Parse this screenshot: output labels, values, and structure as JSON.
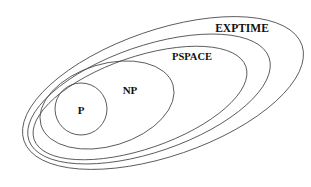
{
  "figure": {
    "background_color": "#ffffff",
    "stroke_color": "#4a4a4a",
    "label_color": "#111111",
    "width": 311,
    "height": 187
  },
  "chart_data": {
    "type": "diagram",
    "subtype": "nested-euler-diagram",
    "title": "",
    "xlabel": "",
    "ylabel": "",
    "legend": [],
    "relation": "P ⊆ NP ⊆ PSPACE ⊆ EXPTIME",
    "regions": [
      {
        "id": "exptime",
        "label": "EXPTIME",
        "shape": "ellipse",
        "cx": 163,
        "cy": 93,
        "rx": 147,
        "ry": 63,
        "rotation": -19,
        "contains": "pspace",
        "label_x": 242,
        "label_y": 29,
        "label_size": 11.5
      },
      {
        "id": "pspace",
        "label": "PSPACE",
        "shape": "ellipse",
        "cx": 149,
        "cy": 99,
        "rx": 127,
        "ry": 53,
        "rotation": -19,
        "contains": "unlabeled-inner",
        "label_x": 192,
        "label_y": 58,
        "label_size": 10.5
      },
      {
        "id": "unlabeled-inner",
        "label": "",
        "shape": "ellipse",
        "cx": 140,
        "cy": 103,
        "rx": 112,
        "ry": 46,
        "rotation": -19,
        "contains": "np",
        "label_x": 0,
        "label_y": 0,
        "label_size": 0
      },
      {
        "id": "np",
        "label": "NP",
        "shape": "ellipse",
        "cx": 107,
        "cy": 105,
        "rx": 69,
        "ry": 41,
        "rotation": -17,
        "contains": "p",
        "label_x": 130,
        "label_y": 91,
        "label_size": 11
      },
      {
        "id": "p",
        "label": "P",
        "shape": "ellipse",
        "cx": 81,
        "cy": 109,
        "rx": 26,
        "ry": 26,
        "rotation": 0,
        "contains": null,
        "label_x": 81,
        "label_y": 111,
        "label_size": 11
      }
    ]
  }
}
